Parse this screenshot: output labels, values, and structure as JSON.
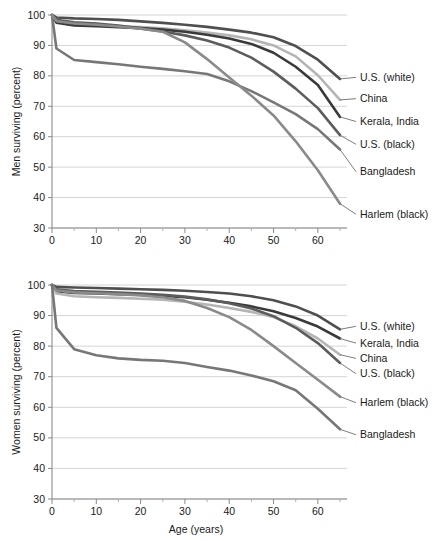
{
  "figure": {
    "background_color": "#ffffff",
    "gridline_color": "#c9c9c9",
    "axis_color": "#8a8a8a"
  },
  "chart_data": [
    {
      "type": "line",
      "id": "men",
      "title": "",
      "xlabel": "",
      "ylabel": "Men surviving (percent)",
      "xlim": [
        0,
        65
      ],
      "ylim": [
        30,
        100
      ],
      "xticks": [
        0,
        10,
        20,
        30,
        40,
        50,
        60
      ],
      "xtick_labels": [
        "0",
        "10",
        "20",
        "30",
        "40",
        "50",
        "60"
      ],
      "xminorticks": [
        5,
        15,
        25,
        35,
        45,
        55,
        65
      ],
      "yticks": [
        30,
        40,
        50,
        60,
        70,
        80,
        90,
        100
      ],
      "ytick_labels": [
        "30",
        "40",
        "50",
        "60",
        "70",
        "80",
        "90",
        "100"
      ],
      "grid": true,
      "legend_position": "right-inline",
      "series": [
        {
          "name": "U.S. (white)",
          "color": "#4f4f4f",
          "width": 2.6,
          "x": [
            0,
            1,
            5,
            10,
            15,
            20,
            25,
            30,
            35,
            40,
            45,
            50,
            55,
            60,
            65
          ],
          "values": [
            100,
            99.2,
            98.9,
            98.7,
            98.4,
            97.9,
            97.4,
            96.8,
            96.1,
            95.2,
            94.2,
            92.7,
            89.8,
            85.3,
            79.0
          ]
        },
        {
          "name": "China",
          "color": "#b5b5b5",
          "width": 2.6,
          "x": [
            0,
            1,
            5,
            10,
            15,
            20,
            25,
            30,
            35,
            40,
            45,
            50,
            55,
            60,
            65
          ],
          "values": [
            100,
            97.8,
            97.0,
            96.6,
            96.3,
            96.0,
            95.6,
            95.0,
            94.2,
            93.3,
            92.0,
            90.0,
            86.4,
            80.2,
            72.1
          ]
        },
        {
          "name": "Kerala, India",
          "color": "#3a3a3a",
          "width": 2.6,
          "x": [
            0,
            1,
            5,
            10,
            15,
            20,
            25,
            30,
            35,
            40,
            45,
            50,
            55,
            60,
            65
          ],
          "values": [
            100,
            97.5,
            96.6,
            96.3,
            96.0,
            95.7,
            95.2,
            94.5,
            93.5,
            92.3,
            90.5,
            87.6,
            83.0,
            77.0,
            66.5
          ]
        },
        {
          "name": "U.S. (black)",
          "color": "#5c5c5c",
          "width": 2.6,
          "x": [
            0,
            1,
            5,
            10,
            15,
            20,
            25,
            30,
            35,
            40,
            45,
            50,
            55,
            60,
            65
          ],
          "values": [
            100,
            98.4,
            97.6,
            97.2,
            96.5,
            95.6,
            94.6,
            93.3,
            91.6,
            89.3,
            86.0,
            81.4,
            75.8,
            69.4,
            60.5
          ]
        },
        {
          "name": "Bangladesh",
          "color": "#777777",
          "width": 2.6,
          "x": [
            0,
            1,
            5,
            10,
            15,
            20,
            25,
            30,
            35,
            40,
            45,
            50,
            55,
            60,
            65
          ],
          "values": [
            100,
            89.0,
            85.2,
            84.5,
            83.8,
            83.0,
            82.3,
            81.5,
            80.6,
            78.2,
            75.0,
            71.3,
            67.4,
            62.5,
            55.8
          ]
        },
        {
          "name": "Harlem (black)",
          "color": "#8a8a8a",
          "width": 2.6,
          "x": [
            0,
            1,
            5,
            10,
            15,
            20,
            25,
            30,
            35,
            40,
            45,
            50,
            55,
            60,
            65
          ],
          "values": [
            100,
            98.0,
            97.2,
            96.8,
            96.2,
            95.5,
            94.5,
            91.0,
            85.5,
            79.5,
            73.5,
            67.0,
            58.5,
            49.0,
            38.0
          ]
        }
      ],
      "annotations": [
        {
          "label": "U.S. (white)",
          "x": 65,
          "y": 79.0
        },
        {
          "label": "China",
          "x": 65,
          "y": 72.1
        },
        {
          "label": "Kerala, India",
          "x": 65,
          "y": 66.5
        },
        {
          "label": "U.S. (black)",
          "x": 65,
          "y": 60.5
        },
        {
          "label": "Bangladesh",
          "x": 65,
          "y": 55.8
        },
        {
          "label": "Harlem (black)",
          "x": 65,
          "y": 38.0
        }
      ]
    },
    {
      "type": "line",
      "id": "women",
      "title": "",
      "xlabel": "Age (years)",
      "ylabel": "Women surviving (percent)",
      "xlim": [
        0,
        65
      ],
      "ylim": [
        30,
        100
      ],
      "xticks": [
        0,
        10,
        20,
        30,
        40,
        50,
        60
      ],
      "xtick_labels": [
        "0",
        "10",
        "20",
        "30",
        "40",
        "50",
        "60"
      ],
      "xminorticks": [
        5,
        15,
        25,
        35,
        45,
        55,
        65
      ],
      "yticks": [
        30,
        40,
        50,
        60,
        70,
        80,
        90,
        100
      ],
      "ytick_labels": [
        "30",
        "40",
        "50",
        "60",
        "70",
        "80",
        "90",
        "100"
      ],
      "grid": true,
      "legend_position": "right-inline",
      "series": [
        {
          "name": "U.S. (white)",
          "color": "#4f4f4f",
          "width": 2.6,
          "x": [
            0,
            1,
            5,
            10,
            15,
            20,
            25,
            30,
            35,
            40,
            45,
            50,
            55,
            60,
            65
          ],
          "values": [
            100,
            99.4,
            99.2,
            99.0,
            98.8,
            98.6,
            98.4,
            98.1,
            97.7,
            97.2,
            96.3,
            95.0,
            93.0,
            90.0,
            85.5
          ]
        },
        {
          "name": "Kerala, India",
          "color": "#3a3a3a",
          "width": 2.6,
          "x": [
            0,
            1,
            5,
            10,
            15,
            20,
            25,
            30,
            35,
            40,
            45,
            50,
            55,
            60,
            65
          ],
          "values": [
            100,
            98.0,
            97.4,
            97.2,
            97.0,
            96.8,
            96.5,
            96.0,
            95.2,
            94.2,
            93.0,
            91.4,
            89.2,
            86.4,
            82.5
          ]
        },
        {
          "name": "China",
          "color": "#b5b5b5",
          "width": 2.6,
          "x": [
            0,
            1,
            5,
            10,
            15,
            20,
            25,
            30,
            35,
            40,
            45,
            50,
            55,
            60,
            65
          ],
          "values": [
            100,
            97.2,
            96.3,
            96.0,
            95.8,
            95.5,
            95.2,
            94.5,
            93.6,
            92.5,
            91.2,
            89.5,
            86.5,
            82.5,
            77.2
          ]
        },
        {
          "name": "U.S. (black)",
          "color": "#5c5c5c",
          "width": 2.6,
          "x": [
            0,
            1,
            5,
            10,
            15,
            20,
            25,
            30,
            35,
            40,
            45,
            50,
            55,
            60,
            65
          ],
          "values": [
            100,
            98.6,
            98.0,
            97.8,
            97.5,
            97.2,
            96.8,
            96.2,
            95.3,
            94.0,
            92.3,
            89.8,
            86.0,
            81.0,
            74.5
          ]
        },
        {
          "name": "Harlem (black)",
          "color": "#8a8a8a",
          "width": 2.6,
          "x": [
            0,
            1,
            5,
            10,
            15,
            20,
            25,
            30,
            35,
            40,
            45,
            50,
            55,
            60,
            65
          ],
          "values": [
            100,
            98.2,
            97.6,
            97.3,
            97.0,
            96.6,
            96.0,
            94.8,
            92.5,
            89.5,
            85.3,
            80.0,
            74.5,
            69.0,
            63.5
          ]
        },
        {
          "name": "Bangladesh",
          "color": "#777777",
          "width": 2.6,
          "x": [
            0,
            1,
            5,
            10,
            15,
            20,
            25,
            30,
            35,
            40,
            45,
            50,
            55,
            60,
            65
          ],
          "values": [
            100,
            86.0,
            79.0,
            77.0,
            76.0,
            75.5,
            75.2,
            74.5,
            73.2,
            72.0,
            70.4,
            68.5,
            65.6,
            59.5,
            52.8
          ]
        }
      ],
      "annotations": [
        {
          "label": "U.S. (white)",
          "x": 65,
          "y": 85.5
        },
        {
          "label": "Kerala, India",
          "x": 65,
          "y": 82.5
        },
        {
          "label": "China",
          "x": 65,
          "y": 77.2
        },
        {
          "label": "U.S. (black)",
          "x": 65,
          "y": 74.5
        },
        {
          "label": "Harlem (black)",
          "x": 65,
          "y": 63.5
        },
        {
          "label": "Bangladesh",
          "x": 65,
          "y": 52.8
        }
      ]
    }
  ]
}
